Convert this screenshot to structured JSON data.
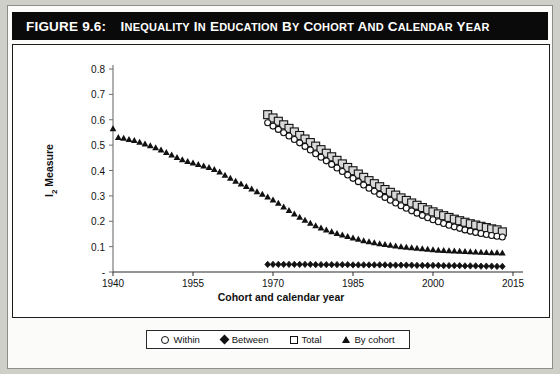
{
  "figure": {
    "label": "FIGURE 9.6:",
    "title": "INEQUALITY IN EDUCATION BY COHORT AND CALENDAR YEAR"
  },
  "legend_position": "below-axis",
  "colors": {
    "total_fill": "#d9d9d9",
    "marker_outline": "#111111",
    "within_fill": "#ffffff",
    "between_fill": "#111111",
    "bycohort_fill": "#111111",
    "title_bar": "#0a0a0a",
    "title_text": "#ffffff"
  },
  "chart_data": {
    "type": "scatter",
    "title": "Inequality in Education by Cohort and Calendar Year",
    "xlabel": "Cohort and calendar year",
    "ylabel": "I2 Measure",
    "xlim": [
      1940,
      2015
    ],
    "ylim": [
      0,
      0.8
    ],
    "xticks": [
      1940,
      1955,
      1970,
      1985,
      2000,
      2015
    ],
    "xtick_labels": [
      "1940",
      "1955",
      "1970",
      "1985",
      "2000",
      "2015"
    ],
    "yticks": [
      0,
      0.1,
      0.2,
      0.3,
      0.4,
      0.5,
      0.6,
      0.7,
      0.8
    ],
    "ytick_labels": [
      "-",
      "0.1",
      "0.2",
      "0.3",
      "0.4",
      "0.5",
      "0.6",
      "0.7",
      "0.8"
    ],
    "grid": false,
    "legend": [
      "Within",
      "Between",
      "Total",
      "By cohort"
    ],
    "series": [
      {
        "name": "Within",
        "marker": "open-circle",
        "x": [
          1969,
          1970,
          1971,
          1972,
          1973,
          1974,
          1975,
          1976,
          1977,
          1978,
          1979,
          1980,
          1981,
          1982,
          1983,
          1984,
          1985,
          1986,
          1987,
          1988,
          1989,
          1990,
          1991,
          1992,
          1993,
          1994,
          1995,
          1996,
          1997,
          1998,
          1999,
          2000,
          2001,
          2002,
          2003,
          2004,
          2005,
          2006,
          2007,
          2008,
          2009,
          2010,
          2011,
          2012,
          2013
        ],
        "y": [
          0.588,
          0.575,
          0.562,
          0.549,
          0.536,
          0.522,
          0.509,
          0.495,
          0.481,
          0.466,
          0.452,
          0.438,
          0.424,
          0.41,
          0.396,
          0.382,
          0.369,
          0.356,
          0.343,
          0.33,
          0.318,
          0.306,
          0.294,
          0.283,
          0.272,
          0.261,
          0.251,
          0.241,
          0.232,
          0.223,
          0.214,
          0.206,
          0.198,
          0.191,
          0.184,
          0.178,
          0.172,
          0.166,
          0.161,
          0.156,
          0.152,
          0.148,
          0.144,
          0.141,
          0.138
        ]
      },
      {
        "name": "Between",
        "marker": "filled-diamond",
        "x": [
          1969,
          1970,
          1971,
          1972,
          1973,
          1974,
          1975,
          1976,
          1977,
          1978,
          1979,
          1980,
          1981,
          1982,
          1983,
          1984,
          1985,
          1986,
          1987,
          1988,
          1989,
          1990,
          1991,
          1992,
          1993,
          1994,
          1995,
          1996,
          1997,
          1998,
          1999,
          2000,
          2001,
          2002,
          2003,
          2004,
          2005,
          2006,
          2007,
          2008,
          2009,
          2010,
          2011,
          2012,
          2013
        ],
        "y": [
          0.03,
          0.03,
          0.03,
          0.03,
          0.03,
          0.03,
          0.03,
          0.03,
          0.03,
          0.029,
          0.029,
          0.029,
          0.029,
          0.029,
          0.029,
          0.029,
          0.028,
          0.028,
          0.028,
          0.028,
          0.028,
          0.028,
          0.028,
          0.027,
          0.027,
          0.027,
          0.027,
          0.027,
          0.026,
          0.026,
          0.026,
          0.026,
          0.026,
          0.025,
          0.025,
          0.025,
          0.025,
          0.024,
          0.024,
          0.024,
          0.023,
          0.023,
          0.023,
          0.022,
          0.022
        ]
      },
      {
        "name": "Total",
        "marker": "gray-square",
        "x": [
          1969,
          1970,
          1971,
          1972,
          1973,
          1974,
          1975,
          1976,
          1977,
          1978,
          1979,
          1980,
          1981,
          1982,
          1983,
          1984,
          1985,
          1986,
          1987,
          1988,
          1989,
          1990,
          1991,
          1992,
          1993,
          1994,
          1995,
          1996,
          1997,
          1998,
          1999,
          2000,
          2001,
          2002,
          2003,
          2004,
          2005,
          2006,
          2007,
          2008,
          2009,
          2010,
          2011,
          2012,
          2013
        ],
        "y": [
          0.62,
          0.607,
          0.594,
          0.58,
          0.566,
          0.552,
          0.538,
          0.524,
          0.51,
          0.496,
          0.482,
          0.468,
          0.454,
          0.44,
          0.426,
          0.412,
          0.399,
          0.386,
          0.373,
          0.36,
          0.348,
          0.336,
          0.325,
          0.314,
          0.303,
          0.292,
          0.282,
          0.272,
          0.263,
          0.254,
          0.245,
          0.237,
          0.229,
          0.222,
          0.215,
          0.208,
          0.202,
          0.196,
          0.19,
          0.185,
          0.18,
          0.175,
          0.17,
          0.166,
          0.158
        ]
      },
      {
        "name": "By cohort",
        "marker": "filled-triangle",
        "x": [
          1940,
          1941,
          1942,
          1943,
          1944,
          1945,
          1946,
          1947,
          1948,
          1949,
          1950,
          1951,
          1952,
          1953,
          1954,
          1955,
          1956,
          1957,
          1958,
          1959,
          1960,
          1961,
          1962,
          1963,
          1964,
          1965,
          1966,
          1967,
          1968,
          1969,
          1970,
          1971,
          1972,
          1973,
          1974,
          1975,
          1976,
          1977,
          1978,
          1979,
          1980,
          1981,
          1982,
          1983,
          1984,
          1985,
          1986,
          1987,
          1988,
          1989,
          1990,
          1991,
          1992,
          1993,
          1994,
          1995,
          1996,
          1997,
          1998,
          1999,
          2000,
          2001,
          2002,
          2003,
          2004,
          2005,
          2006,
          2007,
          2008,
          2009,
          2010,
          2011,
          2012,
          2013
        ],
        "y": [
          0.565,
          0.53,
          0.527,
          0.523,
          0.519,
          0.512,
          0.505,
          0.498,
          0.49,
          0.481,
          0.471,
          0.461,
          0.452,
          0.443,
          0.436,
          0.43,
          0.424,
          0.418,
          0.412,
          0.404,
          0.394,
          0.382,
          0.37,
          0.358,
          0.347,
          0.337,
          0.327,
          0.317,
          0.307,
          0.296,
          0.284,
          0.271,
          0.257,
          0.243,
          0.229,
          0.216,
          0.204,
          0.193,
          0.183,
          0.174,
          0.166,
          0.159,
          0.152,
          0.146,
          0.14,
          0.134,
          0.129,
          0.124,
          0.12,
          0.116,
          0.112,
          0.109,
          0.106,
          0.103,
          0.1,
          0.098,
          0.096,
          0.094,
          0.092,
          0.09,
          0.088,
          0.086,
          0.085,
          0.084,
          0.083,
          0.082,
          0.081,
          0.08,
          0.079,
          0.078,
          0.077,
          0.076,
          0.076,
          0.075
        ]
      }
    ]
  }
}
